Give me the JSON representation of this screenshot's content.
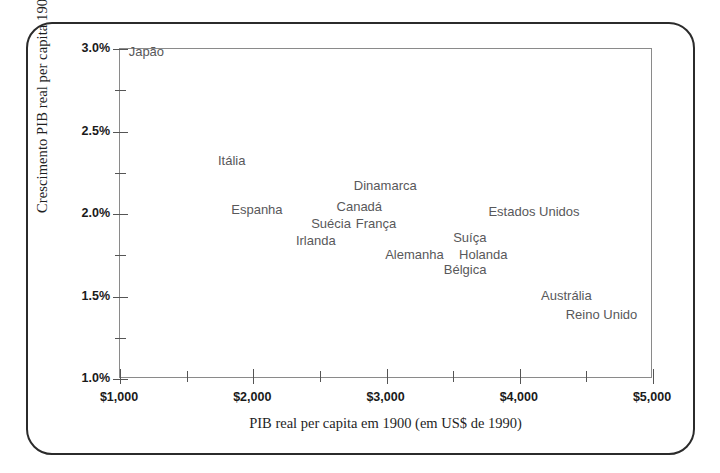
{
  "chart_data": {
    "type": "scatter",
    "title": "",
    "xlabel": "PIB real per capita em 1900 (em US$ de 1990)",
    "ylabel": "Crescimento PIB real per capita 1900-2000",
    "xlim": [
      1000,
      5000
    ],
    "ylim": [
      1.0,
      3.0
    ],
    "grid": false,
    "legend": "none",
    "x_ticks": [
      {
        "value": 1000,
        "label": "$1,000"
      },
      {
        "value": 1500,
        "label": ""
      },
      {
        "value": 2000,
        "label": "$2,000"
      },
      {
        "value": 2500,
        "label": ""
      },
      {
        "value": 3000,
        "label": "$3,000"
      },
      {
        "value": 3500,
        "label": ""
      },
      {
        "value": 4000,
        "label": "$4,000"
      },
      {
        "value": 4500,
        "label": ""
      },
      {
        "value": 5000,
        "label": "$5,000"
      }
    ],
    "y_ticks": [
      {
        "value": 1.0,
        "label": "1.0%"
      },
      {
        "value": 1.25,
        "label": ""
      },
      {
        "value": 1.5,
        "label": "1.5%"
      },
      {
        "value": 1.75,
        "label": ""
      },
      {
        "value": 2.0,
        "label": "2.0%"
      },
      {
        "value": 2.25,
        "label": ""
      },
      {
        "value": 2.5,
        "label": "2.5%"
      },
      {
        "value": 2.75,
        "label": ""
      },
      {
        "value": 3.0,
        "label": "3.0%"
      }
    ],
    "points": [
      {
        "label": "Japão",
        "x": 1050,
        "y": 2.99,
        "anchor": "start"
      },
      {
        "label": "Itália",
        "x": 1720,
        "y": 2.325,
        "anchor": "start"
      },
      {
        "label": "Espanha",
        "x": 1820,
        "y": 2.03,
        "anchor": "start"
      },
      {
        "label": "Dinamarca",
        "x": 2740,
        "y": 2.175,
        "anchor": "start"
      },
      {
        "label": "Canadá",
        "x": 2610,
        "y": 2.05,
        "anchor": "start"
      },
      {
        "label": "Suécia",
        "x": 2420,
        "y": 1.945,
        "anchor": "start"
      },
      {
        "label": "França",
        "x": 2755,
        "y": 1.945,
        "anchor": "start"
      },
      {
        "label": "Irlanda",
        "x": 2305,
        "y": 1.84,
        "anchor": "start"
      },
      {
        "label": "Estados Unidos",
        "x": 3750,
        "y": 2.02,
        "anchor": "start"
      },
      {
        "label": "Suíça",
        "x": 3485,
        "y": 1.86,
        "anchor": "start"
      },
      {
        "label": "Alemanha",
        "x": 2975,
        "y": 1.76,
        "anchor": "start"
      },
      {
        "label": "Holanda",
        "x": 3530,
        "y": 1.76,
        "anchor": "start"
      },
      {
        "label": "Bélgica",
        "x": 3415,
        "y": 1.665,
        "anchor": "start"
      },
      {
        "label": "Austrália",
        "x": 4145,
        "y": 1.51,
        "anchor": "start"
      },
      {
        "label": "Reino Unido",
        "x": 4330,
        "y": 1.395,
        "anchor": "start"
      }
    ]
  },
  "style": {
    "frame_color": "#2b2b2b",
    "axis_color": "#8a8a8a",
    "tick_color": "#555555",
    "label_color": "#58585a",
    "tick_text_color": "#1a1a1a",
    "title_color": "#1f1f1f",
    "background": "#ffffff"
  }
}
